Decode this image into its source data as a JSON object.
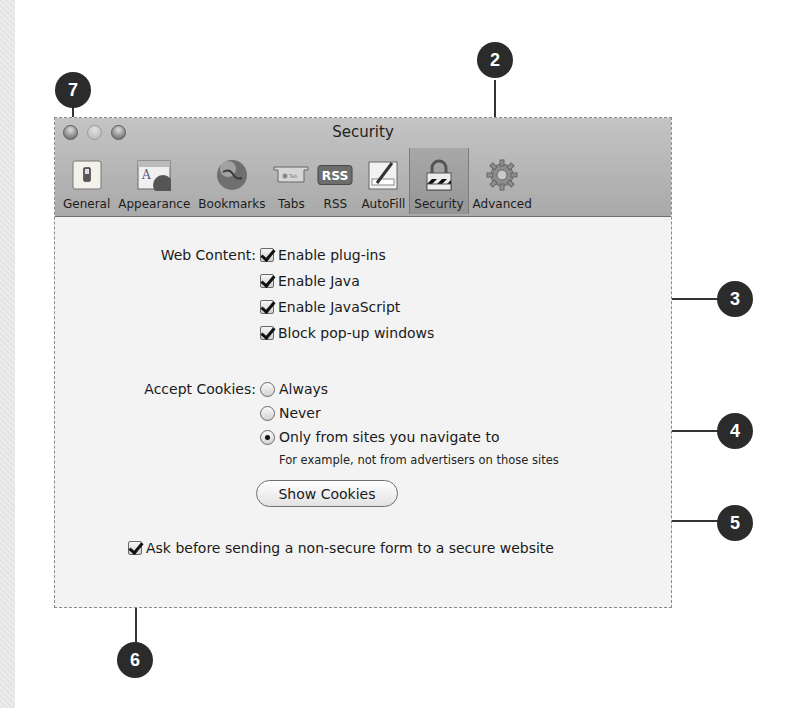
{
  "window": {
    "title": "Security",
    "traffic_lights": [
      "close",
      "minimize",
      "zoom"
    ]
  },
  "toolbar": {
    "items": [
      {
        "label": "General",
        "icon": "general-switch-icon"
      },
      {
        "label": "Appearance",
        "icon": "appearance-icon"
      },
      {
        "label": "Bookmarks",
        "icon": "globe-icon"
      },
      {
        "label": "Tabs",
        "icon": "tabs-icon"
      },
      {
        "label": "RSS",
        "icon": "rss-icon",
        "badge": "RSS"
      },
      {
        "label": "AutoFill",
        "icon": "autofill-pencil-icon"
      },
      {
        "label": "Security",
        "icon": "padlock-icon",
        "selected": true
      },
      {
        "label": "Advanced",
        "icon": "gear-icon"
      }
    ]
  },
  "web_content": {
    "label": "Web Content:",
    "options": [
      {
        "label": "Enable plug-ins",
        "checked": true
      },
      {
        "label": "Enable Java",
        "checked": true
      },
      {
        "label": "Enable JavaScript",
        "checked": true
      },
      {
        "label": "Block pop-up windows",
        "checked": true
      }
    ]
  },
  "cookies": {
    "label": "Accept Cookies:",
    "options": [
      {
        "label": "Always",
        "selected": false
      },
      {
        "label": "Never",
        "selected": false
      },
      {
        "label": "Only from sites you navigate to",
        "selected": true
      }
    ],
    "hint": "For example, not from advertisers on those sites",
    "show_button": "Show Cookies"
  },
  "secure_form": {
    "label": "Ask before sending a non-secure form to a secure website",
    "checked": true
  },
  "help": {
    "label": "?"
  },
  "callouts": [
    "7",
    "2",
    "3",
    "4",
    "5",
    "6"
  ]
}
